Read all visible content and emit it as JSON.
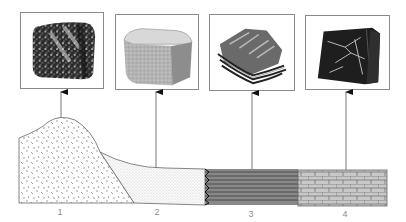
{
  "diagram": {
    "type": "rock-samples-cross-section",
    "samples": [
      {
        "number": "1",
        "texture": "speckled-coarse",
        "frame": {
          "x": 20,
          "y": 12,
          "w": 84,
          "h": 77
        },
        "arrow_x": 61
      },
      {
        "number": "2",
        "texture": "fine-granular-block",
        "frame": {
          "x": 115,
          "y": 14,
          "w": 84,
          "h": 76
        },
        "arrow_x": 156
      },
      {
        "number": "3",
        "texture": "layered-foliated",
        "frame": {
          "x": 209,
          "y": 14,
          "w": 86,
          "h": 77
        },
        "arrow_x": 252
      },
      {
        "number": "4",
        "texture": "dark-veined-block",
        "frame": {
          "x": 305,
          "y": 15,
          "w": 85,
          "h": 75
        },
        "arrow_x": 346
      }
    ],
    "cross_section": {
      "units": [
        {
          "number": "1",
          "pattern": "dashes",
          "label_x": 60
        },
        {
          "number": "2",
          "pattern": "stipple",
          "label_x": 157
        },
        {
          "number": "3",
          "pattern": "horizontal-lines",
          "label_x": 251
        },
        {
          "number": "4",
          "pattern": "brick",
          "label_x": 345
        }
      ]
    },
    "colors": {
      "line": "#555555",
      "frame": "#8a8a8a",
      "label": "#8c8c8c",
      "slate": "#777777",
      "brick_fill": "#c8c8c8"
    }
  }
}
